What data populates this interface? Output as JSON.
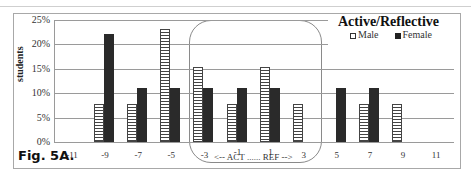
{
  "chart_data": {
    "type": "bar",
    "title": "Active/Reflective",
    "figure_label": "Fig. 5A.",
    "xlabel": "",
    "ylabel": "students",
    "ylim": [
      0,
      25
    ],
    "yticks": [
      "0%",
      "5%",
      "10%",
      "15%",
      "20%",
      "25%"
    ],
    "categories": [
      "-11",
      "-9",
      "-7",
      "-5",
      "-3",
      "-1",
      "1",
      "3",
      "5",
      "7",
      "9",
      "11"
    ],
    "series": [
      {
        "name": "Male",
        "values": [
          0,
          7.7,
          7.7,
          23.1,
          15.4,
          7.7,
          15.4,
          7.7,
          0,
          7.7,
          7.7,
          0
        ]
      },
      {
        "name": "Female",
        "values": [
          0,
          22.2,
          11.1,
          11.1,
          11.1,
          11.1,
          11.1,
          0,
          11.1,
          11.1,
          0,
          0
        ]
      }
    ],
    "legend": {
      "position": "top-right",
      "entries": [
        "Male",
        "Female"
      ]
    },
    "grid": true,
    "annotation": "<-- ACT ...... REF -->",
    "highlight_region": [
      "-3",
      "3"
    ]
  }
}
